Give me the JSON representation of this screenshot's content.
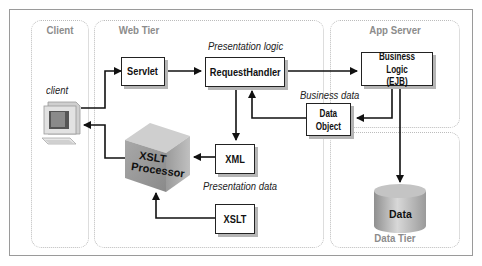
{
  "tiers": {
    "client": "Client",
    "web": "Web Tier",
    "app": "App Server",
    "data": "Data Tier"
  },
  "nodes": {
    "client_label": "client",
    "servlet": "Servlet",
    "request_handler": "RequestHandler",
    "business_logic_line1": "Business Logic",
    "business_logic_line2": "(EJB)",
    "data_object_line1": "Data",
    "data_object_line2": "Object",
    "xml": "XML",
    "xslt": "XSLT",
    "xslt_processor_line1": "XSLT",
    "xslt_processor_line2": "Processor",
    "data_store": "Data"
  },
  "annotations": {
    "presentation_logic": "Presentation logic",
    "business_data": "Business data",
    "presentation_data": "Presentation data"
  }
}
